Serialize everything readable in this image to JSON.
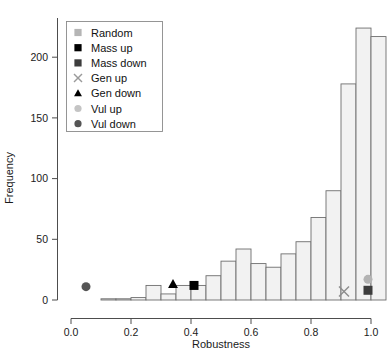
{
  "chart_data": {
    "type": "bar",
    "title": "",
    "subtitle": "",
    "xlabel": "Robustness",
    "ylabel": "Frequency",
    "xlim": [
      0.0,
      1.0
    ],
    "ylim": [
      0,
      230
    ],
    "grid": false,
    "bin_width": 0.05,
    "x_ticks": [
      "0.0",
      "0.2",
      "0.4",
      "0.6",
      "0.8",
      "1.0"
    ],
    "x_tick_values": [
      0.0,
      0.2,
      0.4,
      0.6,
      0.8,
      1.0
    ],
    "y_ticks": [
      "0",
      "50",
      "100",
      "150",
      "200"
    ],
    "y_tick_values": [
      0,
      50,
      100,
      150,
      200
    ],
    "bin_starts": [
      0.1,
      0.15,
      0.2,
      0.25,
      0.3,
      0.35,
      0.4,
      0.45,
      0.5,
      0.55,
      0.6,
      0.65,
      0.7,
      0.75,
      0.8,
      0.85,
      0.9,
      0.95
    ],
    "values": [
      1,
      1,
      2,
      12,
      5,
      12,
      12,
      20,
      32,
      42,
      30,
      27,
      38,
      48,
      68,
      90,
      178,
      224,
      217
    ],
    "categories": [
      "0.10",
      "0.15",
      "0.20",
      "0.25",
      "0.30",
      "0.35",
      "0.40",
      "0.45",
      "0.50",
      "0.55",
      "0.60",
      "0.65",
      "0.70",
      "0.75",
      "0.80",
      "0.85",
      "0.90",
      "0.95",
      "1.00"
    ],
    "bar_fill": "#f2f2f2",
    "bar_stroke": "#6e6e6e",
    "annotations": [
      {
        "name": "Vul down",
        "marker": "circle",
        "x": 0.05,
        "y": 11,
        "color": "#555555"
      },
      {
        "name": "Gen down",
        "marker": "triangle",
        "x": 0.34,
        "y": 13,
        "color": "#000000"
      },
      {
        "name": "Mass up",
        "marker": "square",
        "x": 0.41,
        "y": 12,
        "color": "#000000"
      },
      {
        "name": "Gen up",
        "marker": "x",
        "x": 0.91,
        "y": 7,
        "color": "#8c8c8c"
      },
      {
        "name": "Vul up",
        "marker": "circle",
        "x": 0.99,
        "y": 17,
        "color": "#b3b3b3"
      },
      {
        "name": "Mass down",
        "marker": "square",
        "x": 0.99,
        "y": 8,
        "color": "#3d3d3d"
      }
    ],
    "legend_position": "top-left",
    "legend": [
      {
        "label": "Random",
        "marker": "square",
        "color": "#b5b5b5"
      },
      {
        "label": "Mass up",
        "marker": "square",
        "color": "#000000"
      },
      {
        "label": "Mass down",
        "marker": "square",
        "color": "#3d3d3d"
      },
      {
        "label": "Gen up",
        "marker": "x",
        "color": "#9a9a9a"
      },
      {
        "label": "Gen down",
        "marker": "triangle",
        "color": "#000000"
      },
      {
        "label": "Vul up",
        "marker": "circle",
        "color": "#c4c4c4"
      },
      {
        "label": "Vul down",
        "marker": "circle",
        "color": "#555555"
      }
    ]
  }
}
